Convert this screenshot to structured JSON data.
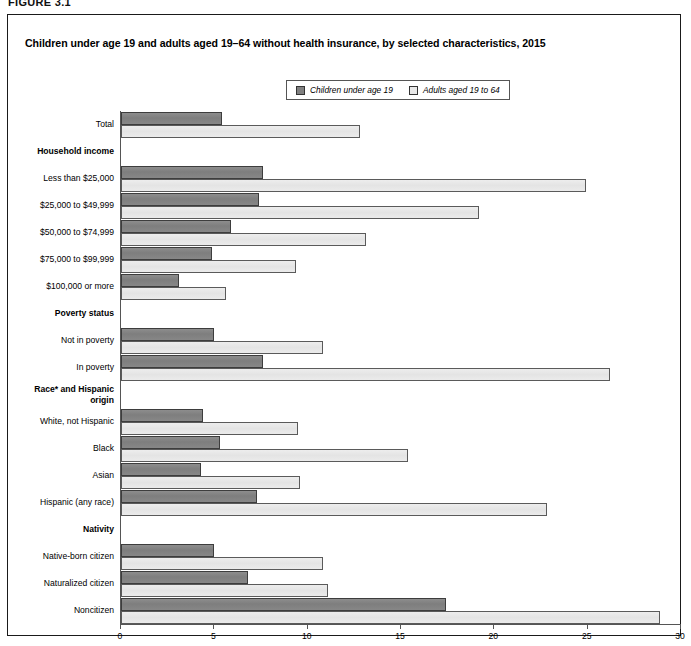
{
  "figure_label": "FIGURE 3.1",
  "chart_title": "Children under age 19 and adults aged 19–64 without health insurance, by selected characteristics, 2015",
  "legend": {
    "items": [
      {
        "label": "Children under age 19",
        "swatch": "dark-gray-swatch",
        "color": "#808080"
      },
      {
        "label": "Adults aged 19 to 64",
        "swatch": "light-gray-swatch",
        "color": "#e8e8e8"
      }
    ]
  },
  "axis": {
    "x_title": "Percent",
    "x_ticks": [
      "0",
      "5",
      "10",
      "15",
      "20",
      "25",
      "30"
    ]
  },
  "chart_data": {
    "type": "bar",
    "orientation": "horizontal",
    "title": "Children under age 19 and adults aged 19–64 without health insurance, by selected characteristics, 2015",
    "xlabel": "Percent",
    "ylabel": "",
    "xlim": [
      0,
      30
    ],
    "xticks": [
      0,
      5,
      10,
      15,
      20,
      25,
      30
    ],
    "grid": false,
    "legend_position": "top-center",
    "footnote": "Race* and Hispanic origin",
    "categories": [
      "Total",
      "Household income",
      "Less than $25,000",
      "$25,000 to $49,999",
      "$50,000 to $74,999",
      "$75,000 to $99,999",
      "$100,000 or more",
      "Poverty status",
      "Not in poverty",
      "In poverty",
      "Race* and Hispanic origin",
      "White, not Hispanic",
      "Black",
      "Asian",
      "Hispanic (any race)",
      "Nativity",
      "Native-born citizen",
      "Naturalized citizen",
      "Noncitizen"
    ],
    "group_headers": [
      "Household income",
      "Poverty status",
      "Race* and Hispanic origin",
      "Nativity"
    ],
    "series": [
      {
        "name": "Children under age 19",
        "color": "#808080",
        "values": [
          5.4,
          null,
          7.6,
          7.4,
          5.9,
          4.9,
          3.1,
          null,
          5.0,
          7.6,
          null,
          4.4,
          5.3,
          4.3,
          7.3,
          null,
          5.0,
          6.8,
          17.4
        ]
      },
      {
        "name": "Adults aged 19 to 64",
        "color": "#e8e8e8",
        "values": [
          12.8,
          null,
          24.9,
          19.2,
          13.1,
          9.4,
          5.6,
          null,
          10.8,
          26.2,
          null,
          9.5,
          15.4,
          9.6,
          22.8,
          null,
          10.8,
          11.1,
          28.9
        ]
      }
    ]
  },
  "rows": [
    {
      "label": "Total",
      "group": false,
      "wrap": false,
      "child": 5.4,
      "adult": 12.8
    },
    {
      "label": "Household income",
      "group": true,
      "wrap": false,
      "child": null,
      "adult": null
    },
    {
      "label": "Less than $25,000",
      "group": false,
      "wrap": false,
      "child": 7.6,
      "adult": 24.9
    },
    {
      "label": "$25,000 to $49,999",
      "group": false,
      "wrap": false,
      "child": 7.4,
      "adult": 19.2
    },
    {
      "label": "$50,000 to $74,999",
      "group": false,
      "wrap": false,
      "child": 5.9,
      "adult": 13.1
    },
    {
      "label": "$75,000 to $99,999",
      "group": false,
      "wrap": false,
      "child": 4.9,
      "adult": 9.4
    },
    {
      "label": "$100,000 or more",
      "group": false,
      "wrap": false,
      "child": 3.1,
      "adult": 5.6
    },
    {
      "label": "Poverty status",
      "group": true,
      "wrap": false,
      "child": null,
      "adult": null
    },
    {
      "label": "Not in poverty",
      "group": false,
      "wrap": false,
      "child": 5.0,
      "adult": 10.8
    },
    {
      "label": "In poverty",
      "group": false,
      "wrap": false,
      "child": 7.6,
      "adult": 26.2
    },
    {
      "label": "Race* and Hispanic origin",
      "group": true,
      "wrap": true,
      "child": null,
      "adult": null
    },
    {
      "label": "White, not Hispanic",
      "group": false,
      "wrap": false,
      "child": 4.4,
      "adult": 9.5
    },
    {
      "label": "Black",
      "group": false,
      "wrap": false,
      "child": 5.3,
      "adult": 15.4
    },
    {
      "label": "Asian",
      "group": false,
      "wrap": false,
      "child": 4.3,
      "adult": 9.6
    },
    {
      "label": "Hispanic (any race)",
      "group": false,
      "wrap": false,
      "child": 7.3,
      "adult": 22.8
    },
    {
      "label": "Nativity",
      "group": true,
      "wrap": false,
      "child": null,
      "adult": null
    },
    {
      "label": "Native-born citizen",
      "group": false,
      "wrap": false,
      "child": 5.0,
      "adult": 10.8
    },
    {
      "label": "Naturalized citizen",
      "group": false,
      "wrap": false,
      "child": 6.8,
      "adult": 11.1
    },
    {
      "label": "Noncitizen",
      "group": false,
      "wrap": false,
      "child": 17.4,
      "adult": 28.9
    }
  ]
}
